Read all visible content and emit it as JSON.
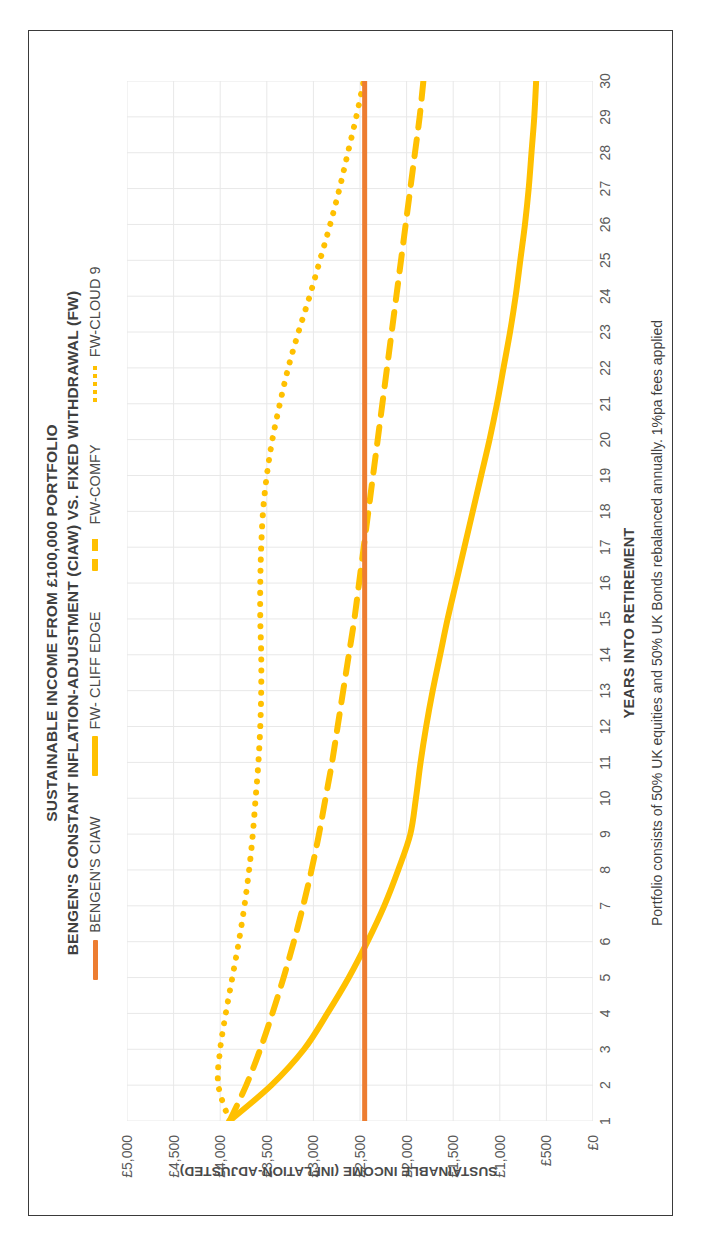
{
  "title": {
    "line1": "SUSTAINABLE INCOME FROM £100,000 PORTFOLIO",
    "line2": "BENGEN'S CONSTANT INFLATION-ADJUSTMENT (CIAW) VS. FIXED WITHDRAWAL (FW)"
  },
  "footnote": "Portfolio consists of 50% UK equities and 50% UK Bonds rebalanced annually.  1%pa fees applied",
  "colors": {
    "ciaw": "#ED7D31",
    "cliff_edge": "#FFC000",
    "comfy": "#FFC000",
    "cloud9": "#FFC000",
    "gridline": "#E8E8E8",
    "text": "#3f3f3f",
    "frame": "#3a3a3a"
  },
  "chart_data": {
    "type": "line",
    "subtitle": "Portfolio consists of 50% UK equities and 50% UK Bonds rebalanced annually.  1%pa fees applied",
    "xlabel": "YEARS INTO RETIREMENT",
    "ylabel": "SUSTAINABLE INCOME (INFLATION-ADJUSTED)",
    "xlim": [
      1,
      30
    ],
    "ylim": [
      0,
      5000
    ],
    "grid": true,
    "legend_position": "top",
    "y_ticks": [
      0,
      500,
      1000,
      1500,
      2000,
      2500,
      3000,
      3500,
      4000,
      4500,
      5000
    ],
    "y_tick_labels": [
      "£0",
      "£500",
      "£1,000",
      "£1,500",
      "£2,000",
      "£2,500",
      "£3,000",
      "£3,500",
      "£4,000",
      "£4,500",
      "£5,000"
    ],
    "x": [
      1,
      2,
      3,
      4,
      5,
      6,
      7,
      8,
      9,
      10,
      11,
      12,
      13,
      14,
      15,
      16,
      17,
      18,
      19,
      20,
      21,
      22,
      23,
      24,
      25,
      26,
      27,
      28,
      29,
      30
    ],
    "x_tick_labels": [
      "1",
      "2",
      "3",
      "4",
      "5",
      "6",
      "7",
      "8",
      "9",
      "10",
      "11",
      "12",
      "13",
      "14",
      "15",
      "16",
      "17",
      "18",
      "19",
      "20",
      "21",
      "22",
      "23",
      "24",
      "25",
      "26",
      "27",
      "28",
      "29",
      "30"
    ],
    "series": [
      {
        "name": "BENGEN'S CIAW",
        "style": "solid",
        "color": "#ED7D31",
        "width": 5,
        "values": [
          2450,
          2450,
          2450,
          2450,
          2450,
          2450,
          2450,
          2450,
          2450,
          2450,
          2450,
          2450,
          2450,
          2450,
          2450,
          2450,
          2450,
          2450,
          2450,
          2450,
          2450,
          2450,
          2450,
          2450,
          2450,
          2450,
          2450,
          2450,
          2450,
          2450
        ]
      },
      {
        "name": "FW- CLIFF EDGE",
        "style": "solid",
        "color": "#FFC000",
        "width": 6,
        "values": [
          3900,
          3450,
          3100,
          2850,
          2620,
          2420,
          2240,
          2090,
          1960,
          1900,
          1850,
          1790,
          1720,
          1640,
          1560,
          1470,
          1380,
          1290,
          1200,
          1110,
          1030,
          960,
          890,
          830,
          780,
          730,
          690,
          660,
          630,
          610
        ]
      },
      {
        "name": "FW-COMFY",
        "style": "dashed",
        "color": "#FFC000",
        "width": 6,
        "values": [
          3900,
          3720,
          3570,
          3440,
          3320,
          3210,
          3110,
          3020,
          2940,
          2870,
          2800,
          2740,
          2680,
          2620,
          2560,
          2510,
          2460,
          2410,
          2360,
          2310,
          2260,
          2210,
          2160,
          2110,
          2060,
          2010,
          1960,
          1910,
          1860,
          1820
        ]
      },
      {
        "name": "FW-CLOUD 9",
        "style": "dotted",
        "color": "#FFC000",
        "width": 6,
        "values": [
          3900,
          4020,
          4000,
          3940,
          3870,
          3800,
          3740,
          3690,
          3650,
          3620,
          3590,
          3570,
          3560,
          3560,
          3570,
          3570,
          3560,
          3540,
          3500,
          3440,
          3360,
          3270,
          3160,
          3040,
          2930,
          2820,
          2720,
          2630,
          2540,
          2460
        ]
      }
    ]
  },
  "axes": {
    "x_title": "YEARS INTO RETIREMENT",
    "y_title": "SUSTAINABLE INCOME (INFLATION-ADJUSTED)"
  },
  "legend": {
    "items": [
      {
        "label": "BENGEN'S CIAW",
        "marker": "solid-orange-line-icon"
      },
      {
        "label": "FW- CLIFF EDGE",
        "marker": "solid-yellow-line-icon"
      },
      {
        "label": "FW-COMFY",
        "marker": "dashed-yellow-line-icon"
      },
      {
        "label": "FW-CLOUD 9",
        "marker": "dotted-yellow-line-icon"
      }
    ]
  }
}
